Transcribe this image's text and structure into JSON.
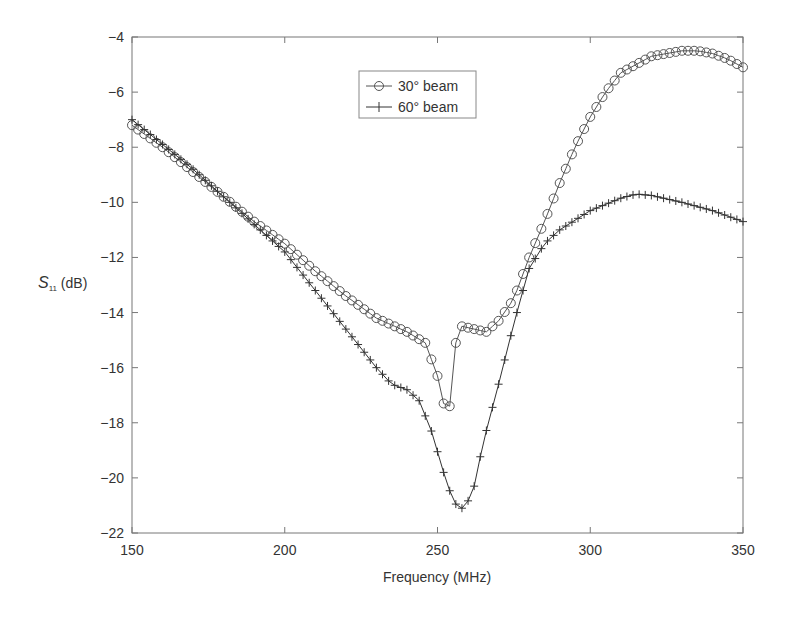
{
  "chart_data": {
    "type": "line",
    "title": "",
    "xlabel": "Frequency (MHz)",
    "ylabel": "S11 (dB)",
    "ylabel_main": "S",
    "ylabel_sub": "11",
    "ylabel_unit": " (dB)",
    "xlim": [
      150,
      350
    ],
    "ylim": [
      -22,
      -4
    ],
    "xticks": [
      150,
      200,
      250,
      300,
      350
    ],
    "yticks": [
      -22,
      -20,
      -18,
      -16,
      -14,
      -12,
      -10,
      -8,
      -6,
      -4
    ],
    "grid": false,
    "legend_position": "upper center",
    "series": [
      {
        "name": "30° beam",
        "marker": "circle",
        "color": "#555555",
        "points": [
          [
            150,
            -7.2
          ],
          [
            160,
            -8.0
          ],
          [
            170,
            -8.9
          ],
          [
            180,
            -9.8
          ],
          [
            190,
            -10.7
          ],
          [
            200,
            -11.5
          ],
          [
            210,
            -12.5
          ],
          [
            220,
            -13.4
          ],
          [
            230,
            -14.2
          ],
          [
            240,
            -14.7
          ],
          [
            246,
            -15.1
          ],
          [
            250,
            -16.3
          ],
          [
            252,
            -17.3
          ],
          [
            254,
            -17.4
          ],
          [
            256,
            -15.1
          ],
          [
            258,
            -14.5
          ],
          [
            262,
            -14.6
          ],
          [
            266,
            -14.7
          ],
          [
            270,
            -14.3
          ],
          [
            275,
            -13.5
          ],
          [
            280,
            -12.0
          ],
          [
            285,
            -10.7
          ],
          [
            290,
            -9.3
          ],
          [
            295,
            -8.0
          ],
          [
            300,
            -6.9
          ],
          [
            305,
            -6.0
          ],
          [
            310,
            -5.3
          ],
          [
            320,
            -4.7
          ],
          [
            330,
            -4.5
          ],
          [
            335,
            -4.5
          ],
          [
            340,
            -4.6
          ],
          [
            345,
            -4.8
          ],
          [
            350,
            -5.1
          ]
        ]
      },
      {
        "name": "60° beam",
        "marker": "plus",
        "color": "#333333",
        "points": [
          [
            150,
            -7.0
          ],
          [
            160,
            -7.9
          ],
          [
            170,
            -8.8
          ],
          [
            180,
            -9.8
          ],
          [
            190,
            -10.8
          ],
          [
            200,
            -11.8
          ],
          [
            210,
            -13.2
          ],
          [
            220,
            -14.6
          ],
          [
            230,
            -16.0
          ],
          [
            235,
            -16.6
          ],
          [
            240,
            -16.8
          ],
          [
            244,
            -17.2
          ],
          [
            248,
            -18.3
          ],
          [
            252,
            -19.8
          ],
          [
            255,
            -20.8
          ],
          [
            257,
            -21.1
          ],
          [
            259,
            -21.1
          ],
          [
            262,
            -20.3
          ],
          [
            265,
            -18.7
          ],
          [
            270,
            -16.6
          ],
          [
            275,
            -14.4
          ],
          [
            280,
            -12.4
          ],
          [
            285,
            -11.5
          ],
          [
            290,
            -11.0
          ],
          [
            300,
            -10.3
          ],
          [
            310,
            -9.85
          ],
          [
            315,
            -9.7
          ],
          [
            320,
            -9.75
          ],
          [
            330,
            -10.0
          ],
          [
            340,
            -10.3
          ],
          [
            350,
            -10.7
          ]
        ]
      }
    ]
  },
  "legend": {
    "items": [
      {
        "label": "30° beam"
      },
      {
        "label": "60° beam"
      }
    ]
  }
}
